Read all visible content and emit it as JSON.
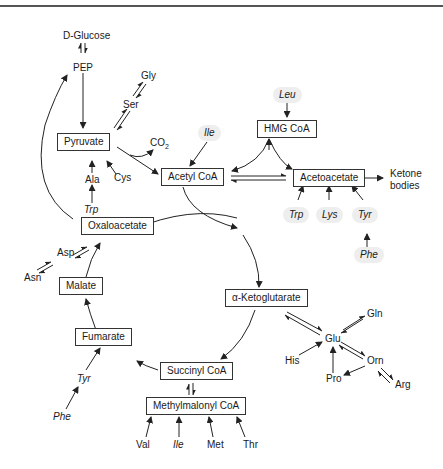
{
  "diagram": {
    "boxes": {
      "pyruvate": "Pyruvate",
      "acetyl_coa": "Acetyl CoA",
      "hmg_coa": "HMG CoA",
      "acetoacetate": "Acetoacetate",
      "oxaloacetate": "Oxaloacetate",
      "malate": "Malate",
      "fumarate": "Fumarate",
      "alpha_ketoglutarate": "α-Ketoglutarate",
      "succinyl_coa": "Succinyl CoA",
      "methylmalonyl_coa": "Methylmalonyl CoA"
    },
    "labels": {
      "d_glucose": "D-Glucose",
      "pep": "PEP",
      "gly": "Gly",
      "ser": "Ser",
      "co2": "CO",
      "co2_sub": "2",
      "cys": "Cys",
      "ala": "Ala",
      "trp_pyruvate": "Trp",
      "ile_acetyl": "Ile",
      "leu": "Leu",
      "ketone_line1": "Ketone",
      "ketone_line2": "bodies",
      "trp_aceto": "Trp",
      "lys": "Lys",
      "tyr_aceto": "Tyr",
      "phe_aceto": "Phe",
      "asp": "Asp",
      "asn": "Asn",
      "tyr_fumarate": "Tyr",
      "phe_fumarate": "Phe",
      "glu": "Glu",
      "gln": "Gln",
      "his": "His",
      "orn": "Orn",
      "pro": "Pro",
      "arg": "Arg",
      "val": "Val",
      "ile_mm": "Ile",
      "met": "Met",
      "thr": "Thr"
    },
    "colors": {
      "line": "#222222",
      "box_border": "#333333",
      "highlight": "#eeeeee"
    }
  }
}
